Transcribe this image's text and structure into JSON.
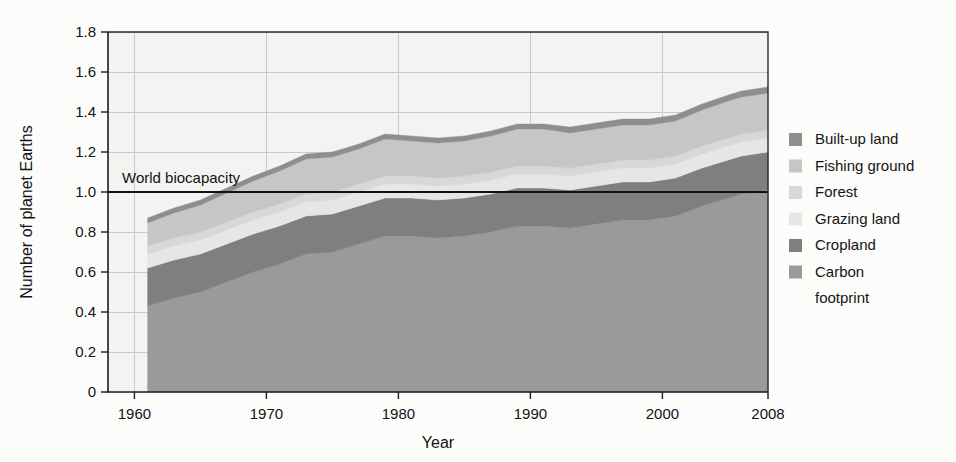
{
  "figure": {
    "background_color": "#fcfcfb",
    "plot_background_color": "#f3f3f1"
  },
  "axis": {
    "y_title": "Number of planet Earths",
    "x_title": "Year",
    "y_ticks": [
      "0",
      "0.2",
      "0.4",
      "0.6",
      "0.8",
      "1.0",
      "1.2",
      "1.4",
      "1.6",
      "1.8"
    ],
    "x_ticks": [
      "1960",
      "1970",
      "1980",
      "1990",
      "2000",
      "2008"
    ]
  },
  "annotation": {
    "biocapacity_label": "World biocapacity",
    "biocapacity_value": 1.0,
    "biocapacity_color": "#111111"
  },
  "legend": {
    "items": [
      {
        "label": "Built-up land",
        "color": "#8e8e8e"
      },
      {
        "label": "Fishing ground",
        "color": "#c6c6c6"
      },
      {
        "label": "Forest",
        "color": "#d8d8d8"
      },
      {
        "label": "Grazing land",
        "color": "#e6e6e6"
      },
      {
        "label": "Cropland",
        "color": "#7f7f7f"
      },
      {
        "label": "Carbon",
        "color": "#9a9a9a"
      },
      {
        "label": "footprint",
        "color": null
      }
    ]
  },
  "chart_data": {
    "type": "area",
    "title": "",
    "xlabel": "Year",
    "ylabel": "Number of planet Earths",
    "xlim": [
      1958,
      2008
    ],
    "ylim": [
      0,
      1.8
    ],
    "grid": true,
    "legend_position": "right",
    "stacked": true,
    "annotations": [
      {
        "text": "World biocapacity",
        "y": 1.0,
        "type": "hline"
      }
    ],
    "x": [
      1961,
      1963,
      1965,
      1967,
      1969,
      1971,
      1973,
      1975,
      1977,
      1979,
      1981,
      1983,
      1985,
      1987,
      1989,
      1991,
      1993,
      1995,
      1997,
      1999,
      2001,
      2003,
      2005,
      2006,
      2007,
      2008
    ],
    "series": [
      {
        "name": "Carbon footprint",
        "color": "#9a9a9a",
        "values": [
          0.43,
          0.47,
          0.5,
          0.55,
          0.6,
          0.64,
          0.69,
          0.7,
          0.74,
          0.78,
          0.78,
          0.77,
          0.78,
          0.8,
          0.83,
          0.83,
          0.82,
          0.84,
          0.86,
          0.86,
          0.88,
          0.93,
          0.97,
          0.99,
          1.0,
          1.01
        ]
      },
      {
        "name": "Cropland",
        "color": "#7f7f7f",
        "values": [
          0.19,
          0.19,
          0.19,
          0.19,
          0.19,
          0.19,
          0.19,
          0.19,
          0.19,
          0.19,
          0.19,
          0.19,
          0.19,
          0.19,
          0.19,
          0.19,
          0.19,
          0.19,
          0.19,
          0.19,
          0.19,
          0.19,
          0.19,
          0.19,
          0.19,
          0.19
        ]
      },
      {
        "name": "Grazing land",
        "color": "#e6e6e6",
        "values": [
          0.07,
          0.07,
          0.07,
          0.07,
          0.07,
          0.07,
          0.07,
          0.07,
          0.07,
          0.07,
          0.07,
          0.07,
          0.07,
          0.07,
          0.07,
          0.07,
          0.07,
          0.07,
          0.07,
          0.07,
          0.07,
          0.07,
          0.07,
          0.07,
          0.07,
          0.07
        ]
      },
      {
        "name": "Forest",
        "color": "#d8d8d8",
        "values": [
          0.04,
          0.04,
          0.04,
          0.04,
          0.04,
          0.04,
          0.04,
          0.04,
          0.04,
          0.04,
          0.04,
          0.04,
          0.04,
          0.04,
          0.04,
          0.04,
          0.04,
          0.04,
          0.04,
          0.04,
          0.04,
          0.04,
          0.04,
          0.04,
          0.04,
          0.04
        ]
      },
      {
        "name": "Fishing ground",
        "color": "#c6c6c6",
        "values": [
          0.115,
          0.125,
          0.135,
          0.145,
          0.155,
          0.165,
          0.175,
          0.175,
          0.175,
          0.185,
          0.175,
          0.175,
          0.175,
          0.18,
          0.185,
          0.185,
          0.175,
          0.175,
          0.175,
          0.175,
          0.175,
          0.18,
          0.185,
          0.185,
          0.185,
          0.185
        ]
      },
      {
        "name": "Built-up land",
        "color": "#8e8e8e",
        "values": [
          0.025,
          0.025,
          0.025,
          0.025,
          0.025,
          0.025,
          0.025,
          0.025,
          0.025,
          0.025,
          0.025,
          0.025,
          0.025,
          0.025,
          0.025,
          0.025,
          0.03,
          0.03,
          0.03,
          0.03,
          0.03,
          0.03,
          0.03,
          0.03,
          0.03,
          0.03
        ]
      }
    ],
    "totals": [
      0.87,
      0.92,
      0.96,
      1.02,
      1.08,
      1.12,
      1.17,
      1.18,
      1.22,
      1.27,
      1.26,
      1.25,
      1.26,
      1.29,
      1.32,
      1.32,
      1.305,
      1.325,
      1.345,
      1.345,
      1.365,
      1.42,
      1.465,
      1.485,
      1.495,
      1.505
    ]
  }
}
